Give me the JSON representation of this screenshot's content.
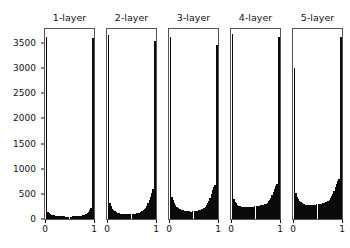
{
  "figure": {
    "background": "#ffffff",
    "foreground": "#111111",
    "bar_color": "#0a0a0a",
    "axis_color": "#555555"
  },
  "chart_data": {
    "type": "bar",
    "title": "",
    "subtitle": "",
    "xlabel": "",
    "ylabel": "",
    "grid": false,
    "legend": null,
    "layout": {
      "rows": 1,
      "cols": 5,
      "shared_y": true
    },
    "xlim": [
      0,
      1
    ],
    "ylim": [
      0,
      3800
    ],
    "xticks": [
      0,
      1
    ],
    "xtick_labels": [
      "0",
      "1"
    ],
    "yticks": [
      0,
      500,
      1000,
      1500,
      2000,
      2500,
      3000,
      3500
    ],
    "ytick_labels": [
      "0",
      "500",
      "1000",
      "1500",
      "2000",
      "2500",
      "3000",
      "3500"
    ],
    "panels": [
      {
        "title": "1-layer",
        "xlabel": "",
        "ylabel": "",
        "edge_spikes": {
          "left": 3650,
          "right": 3620
        },
        "bin_edges": [
          0.0,
          0.025,
          0.05,
          0.075,
          0.1,
          0.125,
          0.15,
          0.175,
          0.2,
          0.225,
          0.25,
          0.275,
          0.3,
          0.325,
          0.35,
          0.375,
          0.4,
          0.425,
          0.45,
          0.475,
          0.5,
          0.525,
          0.55,
          0.575,
          0.6,
          0.625,
          0.65,
          0.675,
          0.7,
          0.725,
          0.75,
          0.775,
          0.8,
          0.825,
          0.85,
          0.875,
          0.9,
          0.925,
          0.95,
          0.975,
          1.0
        ],
        "values": [
          3650,
          230,
          150,
          115,
          95,
          85,
          80,
          72,
          68,
          64,
          60,
          58,
          56,
          54,
          52,
          52,
          50,
          50,
          50,
          50,
          50,
          50,
          52,
          52,
          54,
          56,
          58,
          60,
          64,
          68,
          72,
          80,
          88,
          100,
          118,
          140,
          175,
          230,
          300,
          3620
        ]
      },
      {
        "title": "2-layer",
        "xlabel": "",
        "ylabel": "",
        "edge_spikes": {
          "left": 3680,
          "right": 3560
        },
        "bin_edges": [
          0.0,
          0.025,
          0.05,
          0.075,
          0.1,
          0.125,
          0.15,
          0.175,
          0.2,
          0.225,
          0.25,
          0.275,
          0.3,
          0.325,
          0.35,
          0.375,
          0.4,
          0.425,
          0.45,
          0.475,
          0.5,
          0.525,
          0.55,
          0.575,
          0.6,
          0.625,
          0.65,
          0.675,
          0.7,
          0.725,
          0.75,
          0.775,
          0.8,
          0.825,
          0.85,
          0.875,
          0.9,
          0.925,
          0.95,
          0.975,
          1.0
        ],
        "values": [
          3680,
          430,
          330,
          255,
          205,
          175,
          155,
          140,
          128,
          120,
          112,
          108,
          104,
          100,
          98,
          96,
          95,
          95,
          95,
          96,
          98,
          100,
          104,
          108,
          112,
          120,
          128,
          140,
          155,
          175,
          200,
          230,
          270,
          320,
          380,
          450,
          520,
          600,
          660,
          3560
        ]
      },
      {
        "title": "3-layer",
        "xlabel": "",
        "ylabel": "",
        "edge_spikes": {
          "left": 3640,
          "right": 3480
        },
        "bin_edges": [
          0.0,
          0.025,
          0.05,
          0.075,
          0.1,
          0.125,
          0.15,
          0.175,
          0.2,
          0.225,
          0.25,
          0.275,
          0.3,
          0.325,
          0.35,
          0.375,
          0.4,
          0.425,
          0.45,
          0.475,
          0.5,
          0.525,
          0.55,
          0.575,
          0.6,
          0.625,
          0.65,
          0.675,
          0.7,
          0.725,
          0.75,
          0.775,
          0.8,
          0.825,
          0.85,
          0.875,
          0.9,
          0.925,
          0.95,
          0.975,
          1.0
        ],
        "values": [
          3640,
          560,
          450,
          375,
          320,
          280,
          250,
          228,
          210,
          196,
          184,
          175,
          168,
          162,
          158,
          155,
          152,
          150,
          150,
          152,
          155,
          158,
          162,
          168,
          175,
          184,
          196,
          210,
          228,
          250,
          280,
          320,
          370,
          430,
          500,
          575,
          640,
          690,
          720,
          3480
        ]
      },
      {
        "title": "4-layer",
        "xlabel": "",
        "ylabel": "",
        "edge_spikes": {
          "left": 3700,
          "right": 3640
        },
        "bin_edges": [
          0.0,
          0.025,
          0.05,
          0.075,
          0.1,
          0.125,
          0.15,
          0.175,
          0.2,
          0.225,
          0.25,
          0.275,
          0.3,
          0.325,
          0.35,
          0.375,
          0.4,
          0.425,
          0.45,
          0.475,
          0.5,
          0.525,
          0.55,
          0.575,
          0.6,
          0.625,
          0.65,
          0.675,
          0.7,
          0.725,
          0.75,
          0.775,
          0.8,
          0.825,
          0.85,
          0.875,
          0.9,
          0.925,
          0.95,
          0.975,
          1.0
        ],
        "values": [
          3700,
          470,
          400,
          350,
          315,
          290,
          270,
          255,
          245,
          240,
          236,
          234,
          232,
          232,
          234,
          236,
          240,
          244,
          248,
          252,
          256,
          260,
          264,
          268,
          272,
          278,
          286,
          296,
          310,
          330,
          355,
          390,
          430,
          480,
          540,
          600,
          660,
          700,
          730,
          3640
        ]
      },
      {
        "title": "5-layer",
        "xlabel": "",
        "ylabel": "",
        "edge_spikes": {
          "left": 3020,
          "right": 3640
        },
        "bin_edges": [
          0.0,
          0.025,
          0.05,
          0.075,
          0.1,
          0.125,
          0.15,
          0.175,
          0.2,
          0.225,
          0.25,
          0.275,
          0.3,
          0.325,
          0.35,
          0.375,
          0.4,
          0.425,
          0.45,
          0.475,
          0.5,
          0.525,
          0.55,
          0.575,
          0.6,
          0.625,
          0.65,
          0.675,
          0.7,
          0.725,
          0.75,
          0.775,
          0.8,
          0.825,
          0.85,
          0.875,
          0.9,
          0.925,
          0.95,
          0.975,
          1.0
        ],
        "values": [
          3020,
          620,
          520,
          450,
          400,
          365,
          340,
          320,
          305,
          295,
          288,
          282,
          278,
          276,
          276,
          278,
          280,
          284,
          288,
          292,
          296,
          300,
          304,
          310,
          316,
          324,
          334,
          348,
          366,
          390,
          420,
          460,
          510,
          570,
          640,
          710,
          770,
          810,
          840,
          3640
        ]
      }
    ]
  }
}
